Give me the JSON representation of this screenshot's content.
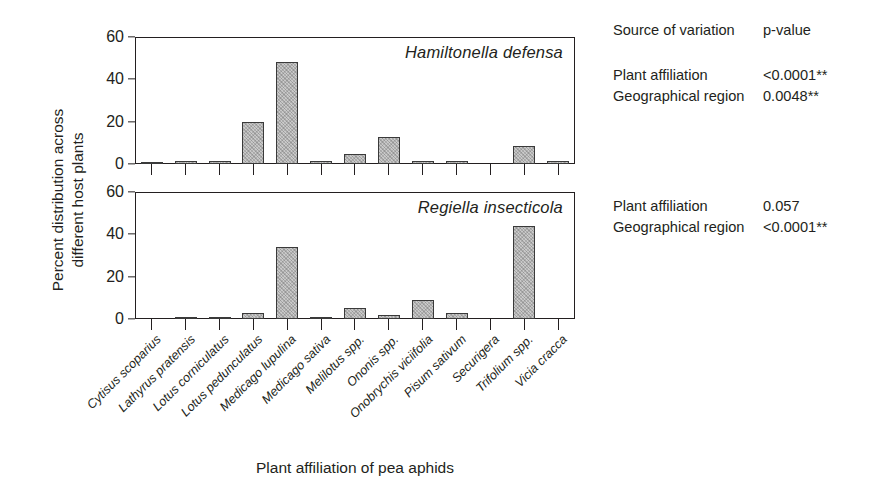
{
  "figure": {
    "ylabel": "Percent distribution across\ndifferent host plants",
    "xlabel": "Plant affiliation of pea aphids"
  },
  "axis": {
    "yticks": [
      0,
      20,
      40,
      60
    ],
    "ylabels": [
      "0",
      "20",
      "40",
      "60"
    ]
  },
  "stats": {
    "header": {
      "source": "Source of variation",
      "pvalue": "p-value"
    },
    "top": [
      {
        "source": "Plant affiliation",
        "p": "<0.0001**"
      },
      {
        "source": "Geographical region",
        "p": "0.0048**"
      }
    ],
    "bottom": [
      {
        "source": "Plant affiliation",
        "p": "0.057"
      },
      {
        "source": "Geographical region",
        "p": "<0.0001**"
      }
    ]
  },
  "chart_data": {
    "type": "bar",
    "title": "",
    "xlabel": "Plant affiliation of pea aphids",
    "ylabel": "Percent distribution across different host plants",
    "ylim": [
      0,
      60
    ],
    "yticks": [
      0,
      20,
      40,
      60
    ],
    "grid": false,
    "legend": "none",
    "categories": [
      "Cytisus scoparius",
      "Lathyrus pratensis",
      "Lotus corniculatus",
      "Lotus pedunculatus",
      "Medicago lupulina",
      "Medicago sativa",
      "Melilotus spp.",
      "Ononis spp.",
      "Onobrychis viciifolia",
      "Pisum sativum",
      "Securigera",
      "Trifolium spp.",
      "Vicia cracca"
    ],
    "panels": [
      {
        "name": "Hamiltonella defensa",
        "annotation": "Hamiltonella defensa",
        "values": [
          0.3,
          1.2,
          1.6,
          19.8,
          48.0,
          1.4,
          4.8,
          12.9,
          1.6,
          1.2,
          0.0,
          8.5,
          1.2
        ]
      },
      {
        "name": "Regiella insecticola",
        "annotation": "Regiella insecticola",
        "values": [
          0.0,
          0.8,
          0.9,
          2.8,
          33.8,
          0.7,
          5.2,
          1.7,
          8.8,
          2.8,
          0.0,
          43.9,
          0.0
        ]
      }
    ]
  }
}
